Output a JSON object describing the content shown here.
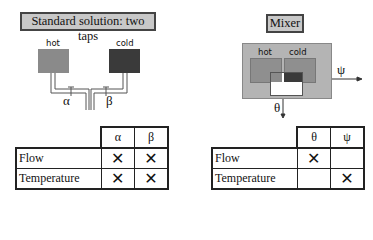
{
  "left": {
    "title": "Standard solution: two taps",
    "hot_label": "hot",
    "cold_label": "cold",
    "control_a": "α",
    "control_b": "β",
    "table": {
      "columns": [
        "α",
        "β"
      ],
      "rows": [
        {
          "label": "Flow",
          "cells": [
            "✕",
            "✕"
          ]
        },
        {
          "label": "Temperature",
          "cells": [
            "✕",
            "✕"
          ]
        }
      ]
    }
  },
  "right": {
    "title": "Mixer",
    "hot_label": "hot",
    "cold_label": "cold",
    "control_theta": "θ",
    "control_psi": "ψ",
    "table": {
      "columns": [
        "θ",
        "ψ"
      ],
      "rows": [
        {
          "label": "Flow",
          "cells": [
            "✕",
            ""
          ]
        },
        {
          "label": "Temperature",
          "cells": [
            "",
            "✕"
          ]
        }
      ]
    }
  },
  "colors": {
    "hot": "#8a8a8a",
    "cold": "#3a3a3a",
    "title_bg": "#c8c8c8",
    "mixer_bg": "#b4b4b4"
  }
}
